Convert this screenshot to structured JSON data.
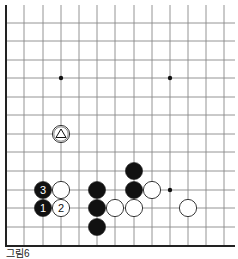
{
  "diagram": {
    "type": "go-board-partial",
    "grid": {
      "x_lines": [
        6,
        24,
        43,
        61,
        79,
        97,
        115,
        134,
        152,
        170,
        188,
        206,
        224
      ],
      "y_lines": [
        23,
        41,
        60,
        78,
        97,
        115,
        134,
        152,
        171,
        190,
        208,
        227,
        246
      ],
      "left_border_x": 6,
      "bottom_border_y": 246,
      "line_color": "#888888",
      "border_color": "#222222"
    },
    "star_points": [
      {
        "x": 61,
        "y": 78
      },
      {
        "x": 170,
        "y": 78
      },
      {
        "x": 170,
        "y": 190
      }
    ],
    "stones": [
      {
        "color": "black",
        "x": 43,
        "y": 190,
        "label": "3"
      },
      {
        "color": "white",
        "x": 61,
        "y": 190,
        "label": ""
      },
      {
        "color": "black",
        "x": 43,
        "y": 208,
        "label": "1"
      },
      {
        "color": "white",
        "x": 61,
        "y": 208,
        "label": "2"
      },
      {
        "color": "white",
        "x": 61,
        "y": 134,
        "label": "△"
      },
      {
        "color": "black",
        "x": 97,
        "y": 190,
        "label": ""
      },
      {
        "color": "black",
        "x": 97,
        "y": 208,
        "label": ""
      },
      {
        "color": "black",
        "x": 97,
        "y": 227,
        "label": ""
      },
      {
        "color": "white",
        "x": 115,
        "y": 208,
        "label": ""
      },
      {
        "color": "white",
        "x": 134,
        "y": 208,
        "label": ""
      },
      {
        "color": "black",
        "x": 134,
        "y": 171,
        "label": ""
      },
      {
        "color": "black",
        "x": 134,
        "y": 190,
        "label": ""
      },
      {
        "color": "white",
        "x": 152,
        "y": 190,
        "label": ""
      },
      {
        "color": "white",
        "x": 188,
        "y": 208,
        "label": ""
      }
    ],
    "caption": "그림6"
  }
}
